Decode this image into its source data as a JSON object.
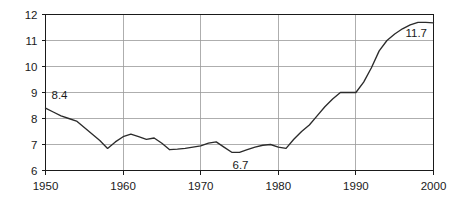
{
  "chart_data": {
    "type": "line",
    "title": "",
    "subtitle": "",
    "xlabel": "",
    "ylabel": "",
    "xlim": [
      1950,
      2000
    ],
    "ylim": [
      6,
      12
    ],
    "grid": true,
    "legend": false,
    "legend_position": "none",
    "x_ticks": [
      1950,
      1960,
      1970,
      1980,
      1990,
      2000
    ],
    "x_tick_labels": [
      "1950",
      "1960",
      "1970",
      "1980",
      "1990",
      "2000"
    ],
    "y_ticks": [
      6,
      7,
      8,
      9,
      10,
      11,
      12
    ],
    "y_tick_labels": [
      "6",
      "7",
      "8",
      "9",
      "10",
      "11",
      "12"
    ],
    "series": [
      {
        "name": "series-1",
        "color": "#2b2b2b",
        "x": [
          1950,
          1951,
          1952,
          1953,
          1954,
          1955,
          1956,
          1957,
          1958,
          1959,
          1960,
          1961,
          1962,
          1963,
          1964,
          1965,
          1966,
          1967,
          1968,
          1969,
          1970,
          1971,
          1972,
          1973,
          1974,
          1975,
          1976,
          1977,
          1978,
          1979,
          1980,
          1981,
          1982,
          1983,
          1984,
          1985,
          1986,
          1987,
          1988,
          1989,
          1990,
          1991,
          1992,
          1993,
          1994,
          1995,
          1996,
          1997,
          1998,
          1999,
          2000
        ],
        "values": [
          8.4,
          8.25,
          8.1,
          8.0,
          7.9,
          7.65,
          7.4,
          7.15,
          6.85,
          7.1,
          7.3,
          7.4,
          7.3,
          7.2,
          7.25,
          7.05,
          6.8,
          6.82,
          6.85,
          6.9,
          6.95,
          7.05,
          7.1,
          6.9,
          6.7,
          6.7,
          6.8,
          6.9,
          6.97,
          7.0,
          6.9,
          6.85,
          7.2,
          7.5,
          7.75,
          8.1,
          8.45,
          8.75,
          9.0,
          9.0,
          9.0,
          9.4,
          9.95,
          10.6,
          11.0,
          11.25,
          11.45,
          11.6,
          11.7,
          11.7,
          11.68
        ]
      }
    ],
    "annotations": [
      {
        "text": "8.4",
        "x": 1950,
        "y": 8.4,
        "dx": 14,
        "dy": -9
      },
      {
        "text": "6.7",
        "x": 1975,
        "y": 6.7,
        "dx": 1,
        "dy": 17
      },
      {
        "text": "11.7",
        "x": 1997,
        "y": 11.7,
        "dx": 6,
        "dy": 15
      }
    ]
  },
  "figure": {
    "background_color": "#ffffff",
    "line_color": "#2b2b2b",
    "grid_color": "#9a9a9a",
    "axis_color": "#1a1a1a",
    "text_color": "#1a1a1a"
  }
}
